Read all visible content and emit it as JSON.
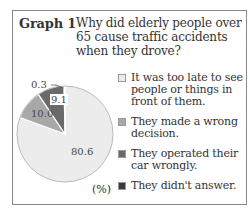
{
  "header": {
    "graph_number": "Graph 1",
    "title": "Why did elderly people over 65 cause traffic accidents when they drove?"
  },
  "unit_label": "(%)",
  "colors": {
    "too_late": "#ececec",
    "wrong_decision": "#a8a8a8",
    "operated_wrongly": "#6a6a6a",
    "no_answer": "#3a3a3a"
  },
  "legend": [
    {
      "label": "It was too late to see people or things in front of them.",
      "color": "#ececec"
    },
    {
      "label": "They made a wrong decision.",
      "color": "#a8a8a8"
    },
    {
      "label": "They operated their car wrongly.",
      "color": "#6a6a6a"
    },
    {
      "label": "They didn't answer.",
      "color": "#3a3a3a"
    }
  ],
  "chart_data": {
    "type": "pie",
    "unit": "%",
    "categories": [
      "It was too late to see people or things in front of them.",
      "They made a wrong decision.",
      "They operated their car wrongly.",
      "They didn't answer."
    ],
    "values": [
      80.6,
      10.0,
      9.1,
      0.3
    ],
    "labels": [
      "80.6",
      "10.0",
      "9.1",
      "0.3"
    ],
    "legend_position": "right"
  }
}
